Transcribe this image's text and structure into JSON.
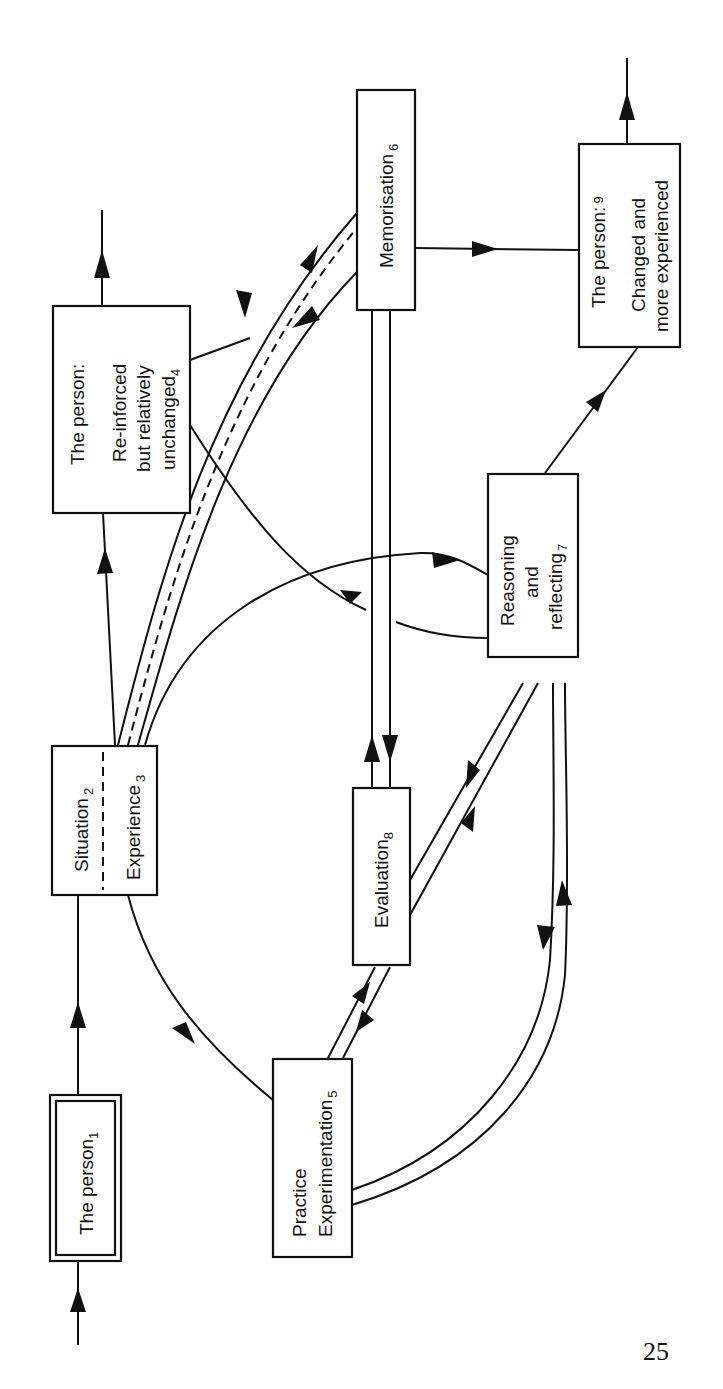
{
  "diagram": {
    "orientation": "rotated -90deg (read bottom to top)",
    "nodes": [
      {
        "id": 1,
        "label": "The person",
        "subscript": "1",
        "style": "double-border"
      },
      {
        "id": 2,
        "label": "Situation",
        "subscript": "2",
        "shared_box_with": 3
      },
      {
        "id": 3,
        "label": "Experience",
        "subscript": "3",
        "shared_box_with": 2
      },
      {
        "id": 4,
        "line1": "The person:",
        "line2": "Re-inforced",
        "line3": "but relatively",
        "line4": "unchanged",
        "subscript": "4"
      },
      {
        "id": 5,
        "line1": "Practice",
        "line2": "Experimentation",
        "subscript": "5"
      },
      {
        "id": 6,
        "label": "Memorisation",
        "subscript": "6"
      },
      {
        "id": 7,
        "line1": "Reasoning",
        "line2": "and",
        "line3": "reflecting",
        "subscript": "7"
      },
      {
        "id": 8,
        "label": "Evaluation",
        "subscript": "8"
      },
      {
        "id": 9,
        "line1": "The person:",
        "line2": "Changed and",
        "line3": "more experienced",
        "subscript": "9"
      }
    ],
    "edges": [
      {
        "from": "input",
        "to": 1
      },
      {
        "from": 1,
        "to": 2
      },
      {
        "from": 2,
        "to": 4
      },
      {
        "from": 4,
        "to": "output"
      },
      {
        "from": 3,
        "to": 6,
        "style": "double with dashed, bidirectional"
      },
      {
        "from": 3,
        "to": 7
      },
      {
        "from": 3,
        "to": 5
      },
      {
        "from": 7,
        "to": 4
      },
      {
        "from": 6,
        "to": 9
      },
      {
        "from": 6,
        "to": 8,
        "style": "double, bidirectional"
      },
      {
        "from": 5,
        "to": 8,
        "style": "double, bidirectional"
      },
      {
        "from": 8,
        "to": 7,
        "style": "double, bidirectional"
      },
      {
        "from": 5,
        "to": 7,
        "style": "double, bidirectional"
      },
      {
        "from": 7,
        "to": 9
      },
      {
        "from": 9,
        "to": "output"
      }
    ]
  },
  "page": {
    "number": "25"
  }
}
